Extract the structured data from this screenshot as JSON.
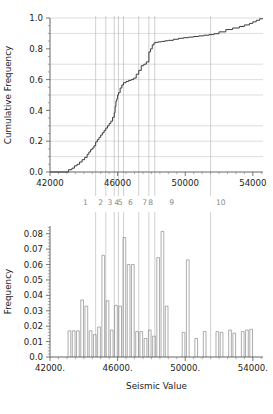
{
  "figure": {
    "title": "",
    "background": "#ffffff",
    "region_labels": [
      "1",
      "2",
      "3",
      "4",
      "5",
      "6",
      "7",
      "8",
      "9",
      "10"
    ],
    "region_label_x": [
      44100,
      45000,
      45550,
      45950,
      46150,
      46750,
      47600,
      47950,
      49200,
      52100
    ],
    "region_boundaries": [
      44700,
      45300,
      45800,
      46050,
      46350,
      47250,
      47850,
      48200,
      51500
    ]
  },
  "chart_data": [
    {
      "type": "line",
      "id": "cumulative-frequency-plot",
      "title": "",
      "xlabel": "",
      "ylabel": "Cumulative Frequency",
      "xlim": [
        42000,
        54600
      ],
      "ylim": [
        0.0,
        1.0
      ],
      "grid": true,
      "grid_axis": "y",
      "xticks": [
        42000,
        46000,
        50000,
        54000
      ],
      "xticklabels": [
        "42000",
        "46000",
        "50000",
        "54000"
      ],
      "yticks": [
        0.0,
        0.2,
        0.4,
        0.6,
        0.8,
        1.0
      ],
      "yticklabels": [
        "0.0",
        "0.2",
        "0.4",
        "0.6",
        "0.8",
        "1.0"
      ],
      "gridline_values": [
        0.1,
        0.2,
        0.3,
        0.5,
        0.6,
        0.7,
        0.9,
        1.0
      ],
      "drawstyle": "steps-post",
      "x": [
        43100,
        43300,
        43450,
        43600,
        43750,
        43900,
        44050,
        44200,
        44300,
        44400,
        44500,
        44600,
        44700,
        44800,
        44900,
        45000,
        45100,
        45200,
        45300,
        45400,
        45500,
        45600,
        45700,
        45800,
        45850,
        45900,
        45950,
        46000,
        46050,
        46150,
        46250,
        46350,
        46500,
        46650,
        46800,
        46950,
        47100,
        47250,
        47400,
        47550,
        47700,
        47850,
        47950,
        48050,
        48150,
        48250,
        48400,
        48600,
        48800,
        49000,
        49300,
        49600,
        49900,
        50200,
        50500,
        50800,
        51100,
        51400,
        51700,
        52000,
        52400,
        52800,
        53200,
        53500,
        53800,
        54000,
        54200,
        54400
      ],
      "y": [
        0.015,
        0.025,
        0.04,
        0.05,
        0.065,
        0.08,
        0.095,
        0.115,
        0.13,
        0.145,
        0.155,
        0.17,
        0.195,
        0.21,
        0.225,
        0.24,
        0.255,
        0.27,
        0.285,
        0.3,
        0.315,
        0.33,
        0.355,
        0.385,
        0.425,
        0.46,
        0.475,
        0.5,
        0.515,
        0.545,
        0.565,
        0.58,
        0.588,
        0.595,
        0.6,
        0.61,
        0.635,
        0.66,
        0.69,
        0.7,
        0.715,
        0.78,
        0.8,
        0.825,
        0.838,
        0.842,
        0.845,
        0.848,
        0.852,
        0.855,
        0.862,
        0.868,
        0.872,
        0.876,
        0.88,
        0.884,
        0.888,
        0.892,
        0.898,
        0.91,
        0.925,
        0.935,
        0.945,
        0.955,
        0.965,
        0.975,
        0.985,
        0.995
      ]
    },
    {
      "type": "bar",
      "id": "frequency-histogram",
      "title": "",
      "xlabel": "Seismic Value",
      "ylabel": "Frequency",
      "xlim": [
        42000,
        54600
      ],
      "ylim": [
        0.0,
        0.085
      ],
      "grid": false,
      "xticks": [
        42000,
        46000,
        50000,
        54000
      ],
      "xticklabels": [
        "42000.",
        "46000.",
        "50000.",
        "54000."
      ],
      "yticks": [
        0.0,
        0.01,
        0.02,
        0.03,
        0.04,
        0.05,
        0.06,
        0.07,
        0.08
      ],
      "yticklabels": [
        "0.0",
        "0.01",
        "0.02",
        "0.03",
        "0.04",
        "0.05",
        "0.06",
        "0.07",
        "0.08"
      ],
      "bar_width": 160,
      "categories": [
        43150,
        43400,
        43650,
        43900,
        44150,
        44400,
        44650,
        44900,
        45150,
        45400,
        45650,
        45900,
        46150,
        46400,
        46650,
        46900,
        47150,
        47400,
        47650,
        47900,
        48150,
        48400,
        48650,
        48900,
        49900,
        50150,
        50650,
        51150,
        51900,
        52150,
        52650,
        52900,
        53400,
        53650,
        53900
      ],
      "values": [
        0.017,
        0.017,
        0.017,
        0.037,
        0.033,
        0.017,
        0.0145,
        0.0195,
        0.066,
        0.0365,
        0.0175,
        0.0335,
        0.033,
        0.0775,
        0.06,
        0.06,
        0.0165,
        0.0165,
        0.012,
        0.0175,
        0.0135,
        0.0645,
        0.0815,
        0.033,
        0.016,
        0.063,
        0.012,
        0.0165,
        0.0165,
        0.016,
        0.0175,
        0.0155,
        0.0165,
        0.0175,
        0.018
      ]
    }
  ]
}
